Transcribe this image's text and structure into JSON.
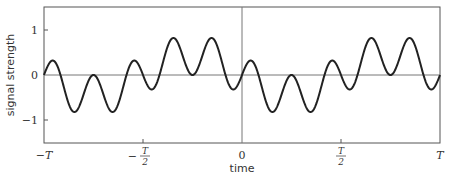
{
  "chart_data": {
    "type": "line",
    "title": "",
    "xlabel": "time",
    "ylabel": "signal strength",
    "xlim": [
      -1,
      1
    ],
    "ylim": [
      -1.5,
      1.5
    ],
    "x_unit": "T",
    "x_ticks": [
      {
        "value": -1,
        "label": "−T"
      },
      {
        "value": -0.5,
        "label": "−T/2"
      },
      {
        "value": 0,
        "label": "0"
      },
      {
        "value": 0.5,
        "label": "T/2"
      },
      {
        "value": 1,
        "label": "T"
      }
    ],
    "y_ticks": [
      {
        "value": 1,
        "label": "1"
      },
      {
        "value": 0,
        "label": "0"
      },
      {
        "value": -1,
        "label": "−1"
      }
    ],
    "grid": false,
    "legend": null,
    "reference_lines": {
      "horizontal_zero": true,
      "vertical_zero": true
    },
    "formula": "y = 0.45·sin(10πt/T) − 0.45·sin(2πt/T)",
    "formula_params": {
      "a_fast": 0.45,
      "fast_cycles_per_T": 5,
      "a_slow": -0.45,
      "slow_cycles_per_T": 1
    },
    "series": [
      {
        "name": "signal",
        "color": "#222222",
        "extrema_x_over_T": [
          -0.95,
          -0.85,
          -0.75,
          -0.65,
          -0.55,
          -0.45,
          -0.35,
          -0.25,
          -0.15,
          -0.05,
          0.05,
          0.15,
          0.25,
          0.35,
          0.45,
          0.55,
          0.65,
          0.75,
          0.85,
          0.95
        ],
        "extrema_y": [
          0.31,
          -0.81,
          0.0,
          -0.81,
          0.31,
          -0.31,
          0.81,
          0.0,
          0.81,
          -0.31,
          0.31,
          -0.81,
          0.0,
          -0.81,
          0.31,
          -0.31,
          0.81,
          0.0,
          0.81,
          -0.31
        ]
      }
    ]
  },
  "labels": {
    "xlabel": "time",
    "ylabel": "signal strength",
    "y1": "1",
    "y0": "0",
    "ym1": "−1",
    "x_negT": "−T",
    "x_neg": "−",
    "x_T": "T",
    "x_2": "2",
    "x_0": "0",
    "x_posT": "T"
  }
}
